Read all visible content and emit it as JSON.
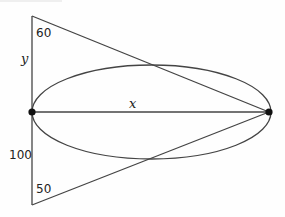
{
  "diagram": {
    "type": "geometry",
    "colors": {
      "stroke": "#444444",
      "dot": "#111111",
      "text": "#222222",
      "background": "#ffffff"
    },
    "labels": {
      "top_angle": "60",
      "bottom_angle": "50",
      "left_upper_side": "y",
      "left_lower_side": "100",
      "horizontal_segment": "x"
    },
    "points": {
      "triangle_top": [
        32,
        16
      ],
      "triangle_bottom": [
        32,
        205
      ],
      "left_dot": [
        32,
        112
      ],
      "right_dot": [
        269,
        112
      ]
    },
    "ellipse": {
      "cx": 151.5,
      "cy": 112,
      "rx": 119.5,
      "ry": 47
    }
  }
}
